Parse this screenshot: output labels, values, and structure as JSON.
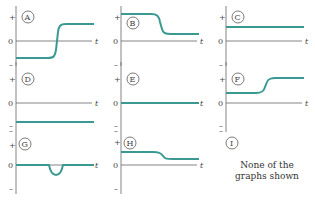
{
  "figure": {
    "axis_labels": {
      "plus": "+",
      "zero": "0",
      "minus": "–",
      "time": "t"
    },
    "curve_color": "#3a9a92",
    "axis_color": "#666666",
    "panels": [
      {
        "id": "A",
        "description": "step up from negative to positive"
      },
      {
        "id": "B",
        "description": "step down from high positive to low positive"
      },
      {
        "id": "C",
        "description": "constant positive"
      },
      {
        "id": "D",
        "description": "constant negative"
      },
      {
        "id": "E",
        "description": "constant zero"
      },
      {
        "id": "F",
        "description": "step up from low positive to high positive"
      },
      {
        "id": "G",
        "description": "zero with a negative dip"
      },
      {
        "id": "H",
        "description": "small step down, both positive"
      },
      {
        "id": "I",
        "description": "none option"
      }
    ],
    "none_option": {
      "id": "I",
      "line1": "None of the",
      "line2": "graphs shown"
    }
  }
}
